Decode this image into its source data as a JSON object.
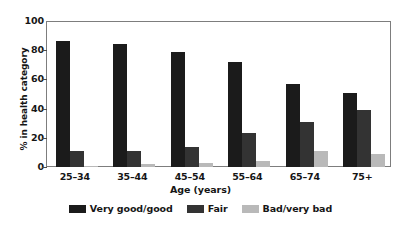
{
  "chart_data": {
    "type": "bar",
    "title": "",
    "xlabel": "Age (years)",
    "ylabel": "% in health category",
    "categories": [
      "25–34",
      "35–44",
      "45–54",
      "55–64",
      "65–74",
      "75+"
    ],
    "series": [
      {
        "name": "Very good/good",
        "values": [
          86,
          84,
          79,
          72,
          57,
          51
        ],
        "color": "#1b1b1b"
      },
      {
        "name": "Fair",
        "values": [
          11,
          11,
          14,
          23,
          31,
          39
        ],
        "color": "#333333"
      },
      {
        "name": "Bad/very bad",
        "values": [
          1,
          2,
          3,
          4,
          11,
          9
        ],
        "color": "#b9b9b9"
      }
    ],
    "ylim": [
      0,
      100
    ],
    "yticks": [
      0,
      20,
      40,
      60,
      80,
      100
    ],
    "ytick_labels": [
      "0",
      "20",
      "40",
      "60",
      "80",
      "100"
    ],
    "grid": false,
    "legend_position": "bottom",
    "frame": true
  }
}
